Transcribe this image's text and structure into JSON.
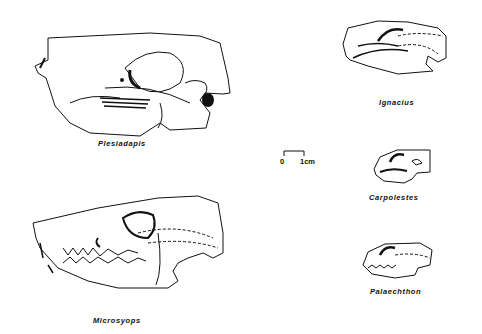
{
  "figure": {
    "specimens": [
      {
        "id": "plesiadapis",
        "label": "Plesiadapis"
      },
      {
        "id": "microsyops",
        "label": "Microsyops"
      },
      {
        "id": "ignacius",
        "label": "Ignacius"
      },
      {
        "id": "carpolestes",
        "label": "Carpolestes"
      },
      {
        "id": "palaechthon",
        "label": "Palaechthon"
      }
    ],
    "scale_bar": {
      "left_label": "0",
      "right_label": "1cm"
    },
    "colors": {
      "ink": "#111111",
      "background": "#ffffff"
    }
  }
}
